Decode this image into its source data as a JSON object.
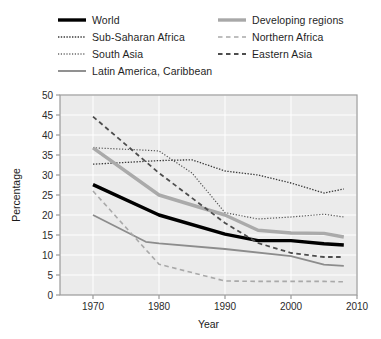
{
  "chart_data": {
    "type": "line",
    "title": "",
    "xlabel": "Year",
    "ylabel": "Percentage",
    "xlim": [
      1965,
      2010
    ],
    "ylim": [
      0,
      50
    ],
    "xticks": [
      1970,
      1980,
      1990,
      2000,
      2010
    ],
    "yticks": [
      0,
      5,
      10,
      15,
      20,
      25,
      30,
      35,
      40,
      45,
      50
    ],
    "grid": true,
    "legend_position": "above-plot",
    "series": [
      {
        "name": "World",
        "style": "solid",
        "color": "#000000",
        "width": 3.4,
        "x": [
          1970,
          1980,
          1990,
          1995,
          2000,
          2005,
          2008
        ],
        "values": [
          27.6,
          20.0,
          15.2,
          13.6,
          13.6,
          12.8,
          12.5
        ]
      },
      {
        "name": "Sub-Saharan Africa",
        "style": "dotted",
        "color": "#3a3a3a",
        "width": 1.3,
        "x": [
          1970,
          1980,
          1985,
          1990,
          1995,
          2000,
          2005,
          2008
        ],
        "values": [
          32.7,
          33.6,
          33.8,
          31.0,
          30.0,
          28.0,
          25.5,
          26.5
        ]
      },
      {
        "name": "South Asia",
        "style": "dotted",
        "color": "#555555",
        "width": 1.2,
        "x": [
          1970,
          1978,
          1980,
          1985,
          1990,
          1995,
          2000,
          2005,
          2008
        ],
        "values": [
          36.8,
          36.2,
          36.0,
          30.5,
          20.6,
          19.0,
          19.5,
          20.2,
          19.5
        ]
      },
      {
        "name": "Latin America, Caribbean",
        "style": "solid",
        "color": "#8c8c8c",
        "width": 1.8,
        "x": [
          1970,
          1978,
          1980,
          1990,
          2000,
          2005,
          2008
        ],
        "values": [
          20.0,
          13.3,
          12.9,
          11.5,
          9.7,
          7.6,
          7.3
        ]
      },
      {
        "name": "Developing regions",
        "style": "solid",
        "color": "#aaaaaa",
        "width": 3.4,
        "x": [
          1970,
          1980,
          1990,
          1995,
          2000,
          2005,
          2008
        ],
        "values": [
          36.8,
          25.0,
          20.0,
          16.2,
          15.5,
          15.4,
          14.5
        ]
      },
      {
        "name": "Northern Africa",
        "style": "dashed",
        "color": "#a9a9a9",
        "width": 1.6,
        "x": [
          1970,
          1980,
          1990,
          1995,
          2000,
          2005,
          2008
        ],
        "values": [
          26.0,
          7.7,
          3.5,
          3.4,
          3.4,
          3.4,
          3.3
        ]
      },
      {
        "name": "Eastern Asia",
        "style": "dashed",
        "color": "#4d4d4d",
        "width": 1.8,
        "x": [
          1970,
          1980,
          1990,
          1995,
          2000,
          2005,
          2008
        ],
        "values": [
          44.6,
          30.5,
          18.0,
          13.0,
          10.5,
          9.5,
          9.5
        ]
      }
    ]
  },
  "legend": {
    "left_column": [
      {
        "label": "World",
        "swatch": "solid-thick-black"
      },
      {
        "label": "Sub-Saharan Africa",
        "swatch": "dotted-dark"
      },
      {
        "label": "South Asia",
        "swatch": "dotted-light"
      },
      {
        "label": "Latin America, Caribbean",
        "swatch": "solid-gray"
      }
    ],
    "right_column": [
      {
        "label": "Developing regions",
        "swatch": "solid-thick-gray"
      },
      {
        "label": "Northern Africa",
        "swatch": "dashed-light-gray"
      },
      {
        "label": "Eastern Asia",
        "swatch": "dashed-dark"
      }
    ]
  },
  "axes": {
    "x_title": "Year",
    "y_title": "Percentage",
    "x_tick_labels": [
      "1970",
      "1980",
      "1990",
      "2000",
      "2010"
    ],
    "y_tick_labels": [
      "0",
      "5",
      "10",
      "15",
      "20",
      "25",
      "30",
      "35",
      "40",
      "45",
      "50"
    ]
  },
  "colors": {
    "plot_background": "#ebebeb",
    "grid": "#ffffff",
    "frame": "#9a9a9a",
    "text": "#1a1a1a"
  }
}
